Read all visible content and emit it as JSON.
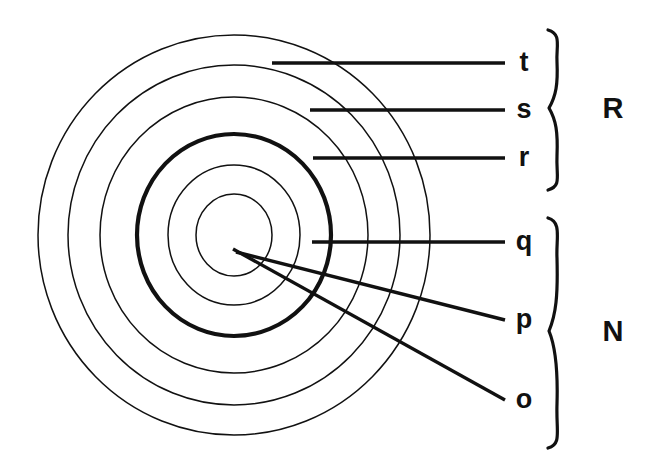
{
  "diagram": {
    "background_color": "#ffffff",
    "stroke_color": "#111111",
    "center": {
      "x": 234,
      "y": 235
    },
    "rings": [
      {
        "id": "ring-t",
        "label": "t",
        "rx": 196,
        "ry": 200,
        "weight": "thin"
      },
      {
        "id": "ring-s",
        "label": "s",
        "rx": 166,
        "ry": 170,
        "weight": "thin"
      },
      {
        "id": "ring-r",
        "label": "r",
        "rx": 134,
        "ry": 138,
        "weight": "thin"
      },
      {
        "id": "ring-q",
        "label": "q",
        "rx": 97,
        "ry": 101,
        "weight": "thick"
      },
      {
        "id": "ring-p",
        "label": "p",
        "rx": 66,
        "ry": 70,
        "weight": "thin"
      },
      {
        "id": "ring-o",
        "label": "o",
        "rx": 38,
        "ry": 41,
        "weight": "thin"
      }
    ],
    "labels": [
      {
        "id": "label-t",
        "text": "t",
        "x": 524,
        "y": 63
      },
      {
        "id": "label-s",
        "text": "s",
        "x": 524,
        "y": 110
      },
      {
        "id": "label-r",
        "text": "r",
        "x": 524,
        "y": 158
      },
      {
        "id": "label-q",
        "text": "q",
        "x": 524,
        "y": 242
      },
      {
        "id": "label-p",
        "text": "p",
        "x": 524,
        "y": 320
      },
      {
        "id": "label-o",
        "text": "o",
        "x": 524,
        "y": 400
      }
    ],
    "leaders": [
      {
        "id": "leader-t",
        "label": "t",
        "x1": 272,
        "y1": 63,
        "x2": 505,
        "y2": 63,
        "kind": "horizontal"
      },
      {
        "id": "leader-s",
        "label": "s",
        "x1": 310,
        "y1": 110,
        "x2": 505,
        "y2": 110,
        "kind": "horizontal"
      },
      {
        "id": "leader-r",
        "label": "r",
        "x1": 313,
        "y1": 158,
        "x2": 505,
        "y2": 158,
        "kind": "horizontal"
      },
      {
        "id": "leader-q",
        "label": "q",
        "x1": 312,
        "y1": 242,
        "x2": 505,
        "y2": 242,
        "kind": "horizontal"
      },
      {
        "id": "leader-p",
        "label": "p",
        "x1": 236,
        "y1": 252,
        "x2": 505,
        "y2": 320,
        "kind": "diagonal"
      },
      {
        "id": "leader-o",
        "label": "o",
        "x1": 233,
        "y1": 249,
        "x2": 505,
        "y2": 400,
        "kind": "diagonal"
      }
    ],
    "groups": [
      {
        "id": "group-R",
        "label": "R",
        "members": [
          "t",
          "s",
          "r"
        ],
        "brace_top": 30,
        "brace_bottom": 190,
        "brace_x": 562,
        "label_x": 613,
        "label_y": 110
      },
      {
        "id": "group-N",
        "label": "N",
        "members": [
          "q",
          "p",
          "o"
        ],
        "brace_top": 218,
        "brace_bottom": 448,
        "brace_x": 562,
        "label_x": 613,
        "label_y": 333
      }
    ]
  }
}
